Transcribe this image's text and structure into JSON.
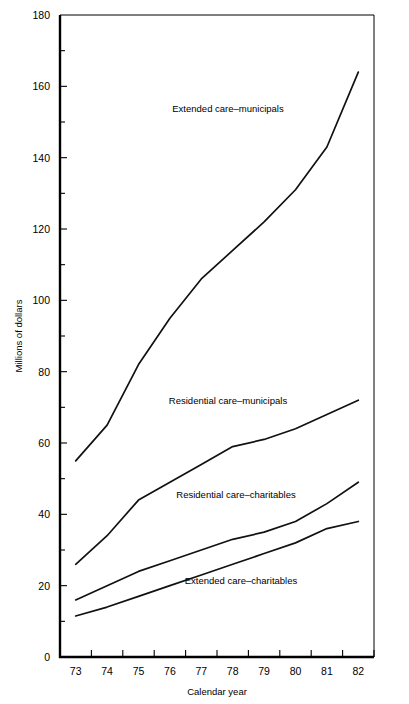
{
  "chart_data": {
    "type": "line",
    "title": "",
    "xlabel": "Calendar year",
    "ylabel": "Millions of dollars",
    "xlim": [
      72.5,
      82.5
    ],
    "ylim": [
      0,
      180
    ],
    "grid": false,
    "legend_position": "inline-annotations",
    "x": [
      73,
      74,
      75,
      76,
      77,
      78,
      79,
      80,
      81,
      82
    ],
    "xtick_labels": [
      "73",
      "74",
      "75",
      "76",
      "77",
      "78",
      "79",
      "80",
      "81",
      "82"
    ],
    "ytick_labels": [
      "0",
      "20",
      "40",
      "60",
      "80",
      "100",
      "120",
      "140",
      "160",
      "180"
    ],
    "ytick_values": [
      0,
      20,
      40,
      60,
      80,
      100,
      120,
      140,
      160,
      180
    ],
    "yminor_values": [
      10,
      30,
      50,
      70,
      90,
      110,
      130,
      150,
      170
    ],
    "series": [
      {
        "name": "Extended care–municipals",
        "label": "Extended care–municipals",
        "values": [
          55,
          65,
          82,
          95,
          106,
          114,
          122,
          131,
          143,
          164
        ]
      },
      {
        "name": "Residential care–municipals",
        "label": "Residential care–municipals",
        "values": [
          26,
          34,
          44,
          49,
          54,
          59,
          61,
          64,
          68,
          72
        ]
      },
      {
        "name": "Residential care–charitables",
        "label": "Residential care–charitables",
        "values": [
          16,
          20,
          24,
          27,
          30,
          33,
          35,
          38,
          43,
          49
        ]
      },
      {
        "name": "Extended care–charitables",
        "label": "Extended care–charitables",
        "values": [
          11.5,
          14,
          17,
          20,
          23,
          26,
          29,
          32,
          36,
          38
        ]
      }
    ],
    "annotations": [
      {
        "text": "Extended care–municipals",
        "x_px": 228,
        "y_px": 112
      },
      {
        "text": "Residential care–municipals",
        "x_px": 228,
        "y_px": 404
      },
      {
        "text": "Residential care–charitables",
        "x_px": 236,
        "y_px": 498
      },
      {
        "text": "Extended care–charitables",
        "x_px": 241,
        "y_px": 584
      }
    ]
  },
  "axis": {
    "x_title": "Calendar year",
    "y_title": "Millions of dollars"
  }
}
